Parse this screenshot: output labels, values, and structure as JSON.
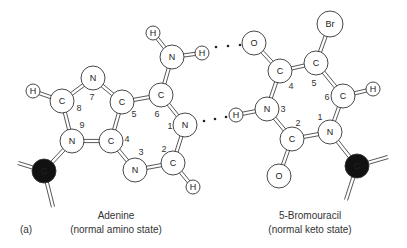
{
  "figure": {
    "panel_label": "(a)",
    "left_molecule": {
      "name": "Adenine",
      "state": "(normal amino state)",
      "atoms": [
        {
          "id": "H8",
          "label": "H",
          "x": 33,
          "y": 91,
          "r": 7
        },
        {
          "id": "C8",
          "label": "C",
          "x": 62,
          "y": 101,
          "r": 12
        },
        {
          "id": "N7",
          "label": "N",
          "x": 93,
          "y": 78,
          "r": 12
        },
        {
          "id": "C5",
          "label": "C",
          "x": 122,
          "y": 102,
          "r": 12
        },
        {
          "id": "C6",
          "label": "C",
          "x": 161,
          "y": 95,
          "r": 12
        },
        {
          "id": "NA",
          "label": "N",
          "x": 172,
          "y": 57,
          "r": 12
        },
        {
          "id": "HA1",
          "label": "H",
          "x": 153,
          "y": 33,
          "r": 7
        },
        {
          "id": "HA2",
          "label": "H",
          "x": 202,
          "y": 53,
          "r": 7
        },
        {
          "id": "N1",
          "label": "N",
          "x": 185,
          "y": 125,
          "r": 12
        },
        {
          "id": "C2",
          "label": "C",
          "x": 173,
          "y": 163,
          "r": 12
        },
        {
          "id": "H2",
          "label": "H",
          "x": 193,
          "y": 187,
          "r": 7
        },
        {
          "id": "N3",
          "label": "N",
          "x": 135,
          "y": 170,
          "r": 12
        },
        {
          "id": "C4",
          "label": "C",
          "x": 111,
          "y": 141,
          "r": 12
        },
        {
          "id": "N9",
          "label": "N",
          "x": 72,
          "y": 141,
          "r": 12
        },
        {
          "id": "CS",
          "label": "C",
          "x": 44,
          "y": 171,
          "r": 12,
          "filled": true
        }
      ],
      "bonds": [
        [
          "H8",
          "C8"
        ],
        [
          "C8",
          "N7"
        ],
        [
          "N7",
          "C5"
        ],
        [
          "C5",
          "C6"
        ],
        [
          "C6",
          "NA"
        ],
        [
          "NA",
          "HA1"
        ],
        [
          "NA",
          "HA2"
        ],
        [
          "C6",
          "N1"
        ],
        [
          "N1",
          "C2"
        ],
        [
          "C2",
          "H2"
        ],
        [
          "C2",
          "N3"
        ],
        [
          "N3",
          "C4"
        ],
        [
          "C4",
          "C5"
        ],
        [
          "C4",
          "N9"
        ],
        [
          "N9",
          "C8"
        ],
        [
          "N9",
          "CS"
        ]
      ],
      "stubs": [
        {
          "from": "CS",
          "x": 18,
          "y": 163
        },
        {
          "from": "CS",
          "x": 53,
          "y": 207
        }
      ],
      "numbers": [
        {
          "t": "8",
          "x": 79,
          "y": 111
        },
        {
          "t": "7",
          "x": 92,
          "y": 100
        },
        {
          "t": "5",
          "x": 134,
          "y": 117
        },
        {
          "t": "6",
          "x": 157,
          "y": 117
        },
        {
          "t": "1",
          "x": 170,
          "y": 129
        },
        {
          "t": "2",
          "x": 164,
          "y": 152
        },
        {
          "t": "3",
          "x": 141,
          "y": 155
        },
        {
          "t": "4",
          "x": 127,
          "y": 142
        },
        {
          "t": "9",
          "x": 82,
          "y": 128
        }
      ]
    },
    "right_molecule": {
      "name": "5-Bromouracil",
      "state": "(normal keto state)",
      "atoms": [
        {
          "id": "O4",
          "label": "O",
          "x": 254,
          "y": 43,
          "r": 12
        },
        {
          "id": "Br",
          "label": "Br",
          "x": 330,
          "y": 24,
          "r": 13
        },
        {
          "id": "C4",
          "label": "C",
          "x": 280,
          "y": 71,
          "r": 12
        },
        {
          "id": "C5",
          "label": "C",
          "x": 316,
          "y": 63,
          "r": 12
        },
        {
          "id": "C6",
          "label": "C",
          "x": 343,
          "y": 96,
          "r": 12
        },
        {
          "id": "H6",
          "label": "H",
          "x": 373,
          "y": 89,
          "r": 7
        },
        {
          "id": "N3",
          "label": "N",
          "x": 267,
          "y": 109,
          "r": 12
        },
        {
          "id": "H3",
          "label": "H",
          "x": 236,
          "y": 115,
          "r": 7
        },
        {
          "id": "C2",
          "label": "C",
          "x": 292,
          "y": 139,
          "r": 12
        },
        {
          "id": "O2",
          "label": "O",
          "x": 279,
          "y": 176,
          "r": 12
        },
        {
          "id": "N1",
          "label": "N",
          "x": 330,
          "y": 132,
          "r": 12
        },
        {
          "id": "CS",
          "label": "C",
          "x": 357,
          "y": 166,
          "r": 12,
          "filled": true
        }
      ],
      "bonds": [
        [
          "O4",
          "C4"
        ],
        [
          "C4",
          "C5"
        ],
        [
          "C5",
          "Br"
        ],
        [
          "C5",
          "C6"
        ],
        [
          "C6",
          "H6"
        ],
        [
          "C6",
          "N1"
        ],
        [
          "N1",
          "C2"
        ],
        [
          "C2",
          "N3"
        ],
        [
          "N3",
          "C4"
        ],
        [
          "N3",
          "H3"
        ],
        [
          "C2",
          "O2"
        ],
        [
          "N1",
          "CS"
        ]
      ],
      "stubs": [
        {
          "from": "CS",
          "x": 388,
          "y": 157
        },
        {
          "from": "CS",
          "x": 346,
          "y": 200
        }
      ],
      "numbers": [
        {
          "t": "4",
          "x": 291,
          "y": 89
        },
        {
          "t": "5",
          "x": 314,
          "y": 86
        },
        {
          "t": "6",
          "x": 327,
          "y": 100
        },
        {
          "t": "3",
          "x": 283,
          "y": 112
        },
        {
          "t": "2",
          "x": 298,
          "y": 126
        },
        {
          "t": "1",
          "x": 320,
          "y": 120
        }
      ]
    },
    "hydrogen_bonds": [
      {
        "x1": 216,
        "y1": 47,
        "x2": 240,
        "y2": 45
      },
      {
        "x1": 204,
        "y1": 121,
        "x2": 226,
        "y2": 117
      }
    ]
  }
}
